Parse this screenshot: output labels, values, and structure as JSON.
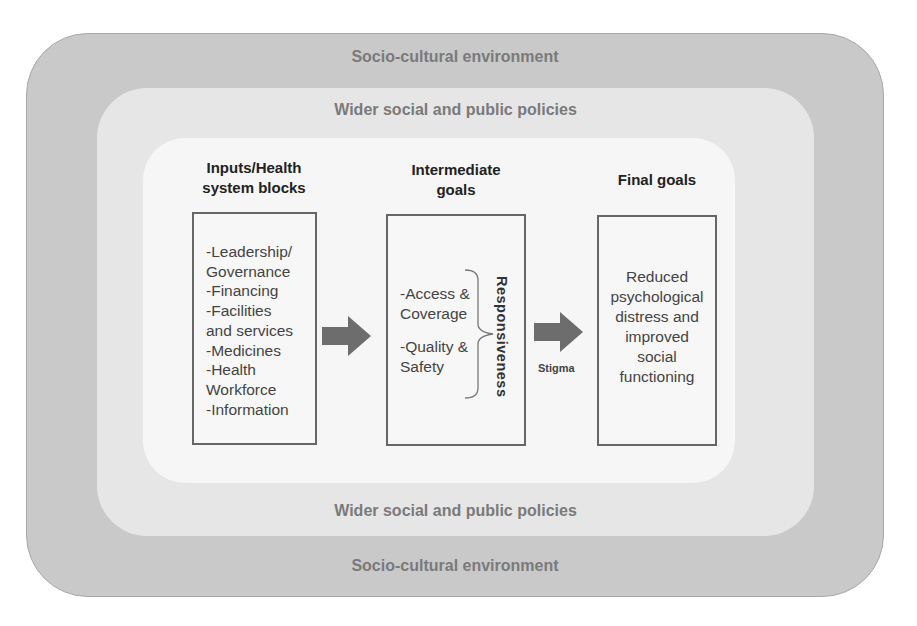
{
  "layers": {
    "outer": {
      "label_top": "Socio-cultural  environment",
      "label_bottom": "Socio-cultural  environment",
      "color": "#c9c9c9"
    },
    "middle": {
      "label_top": "Wider social and public policies",
      "label_bottom": "Wider social and public policies",
      "color": "#e6e6e6"
    },
    "inner": {
      "color": "#f6f6f6"
    }
  },
  "columns": [
    {
      "heading_line1": "Inputs/Health",
      "heading_line2": "system blocks",
      "items": [
        "-Leadership/",
        "Governance",
        "-Financing",
        "-Facilities",
        "and services",
        "-Medicines",
        "-Health",
        "Workforce",
        "-Information"
      ]
    },
    {
      "heading_line1": "Intermediate",
      "heading_line2": "goals",
      "items": [
        "-Access &",
        "Coverage",
        "",
        "-Quality &",
        "Safety"
      ],
      "bracket_label": "Responsiveness"
    },
    {
      "heading_line1": "Final goals",
      "items": [
        "Reduced",
        "psychological",
        "distress and",
        "improved",
        "social",
        "functioning"
      ]
    }
  ],
  "arrows": [
    {
      "from": "Inputs/Health system blocks",
      "to": "Intermediate goals",
      "label": ""
    },
    {
      "from": "Intermediate goals",
      "to": "Final goals",
      "label": "Stigma"
    }
  ],
  "colors": {
    "arrow": "#6d6d6d",
    "box_border": "#666666",
    "layer_text": "#7a7a7a"
  }
}
